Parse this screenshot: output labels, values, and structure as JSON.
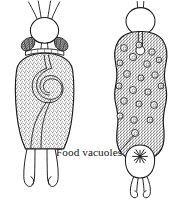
{
  "figure": {
    "kind": "scientific-line-illustration",
    "background_color": "#ffffff",
    "ink_color": "#1a1a1a",
    "stipple_color": "#8a8a8a",
    "width": 179,
    "height": 209
  },
  "annotations": {
    "food_vacuoles_label": "Food vacuoles"
  },
  "specimens": [
    {
      "id": "left-specimen",
      "name": "left-specimen-with-coiled-gut",
      "position": "left",
      "parts": [
        "apical-setae",
        "head-capsule",
        "paired-mandible-clusters",
        "stippled-trunk",
        "coiled-gut-loop",
        "forked-toes"
      ],
      "setae_count": 4,
      "mandible_cluster_count": 2,
      "toe_count": 2
    },
    {
      "id": "right-specimen",
      "name": "right-specimen-with-food-vacuoles",
      "position": "right",
      "parts": [
        "apical-setae",
        "head-capsule",
        "stippled-trunk",
        "food-vacuoles",
        "egg-sac-with-star",
        "forked-toes"
      ],
      "setae_count": 2,
      "vacuole_count": 21,
      "toe_count": 2
    }
  ],
  "vacuoles": [
    {
      "cx": 124,
      "cy": 48,
      "r": 3.4
    },
    {
      "cx": 139,
      "cy": 45,
      "r": 3.0
    },
    {
      "cx": 152,
      "cy": 52,
      "r": 3.2
    },
    {
      "cx": 133,
      "cy": 57,
      "r": 3.6
    },
    {
      "cx": 120,
      "cy": 63,
      "r": 3.0
    },
    {
      "cx": 147,
      "cy": 64,
      "r": 3.3
    },
    {
      "cx": 159,
      "cy": 60,
      "r": 2.8
    },
    {
      "cx": 127,
      "cy": 74,
      "r": 3.4
    },
    {
      "cx": 141,
      "cy": 78,
      "r": 3.0
    },
    {
      "cx": 155,
      "cy": 75,
      "r": 3.2
    },
    {
      "cx": 119,
      "cy": 86,
      "r": 3.0
    },
    {
      "cx": 133,
      "cy": 90,
      "r": 3.5
    },
    {
      "cx": 148,
      "cy": 92,
      "r": 3.1
    },
    {
      "cx": 161,
      "cy": 86,
      "r": 2.9
    },
    {
      "cx": 124,
      "cy": 101,
      "r": 3.3
    },
    {
      "cx": 139,
      "cy": 104,
      "r": 3.0
    },
    {
      "cx": 154,
      "cy": 105,
      "r": 3.4
    },
    {
      "cx": 120,
      "cy": 116,
      "r": 3.1
    },
    {
      "cx": 134,
      "cy": 120,
      "r": 3.3
    },
    {
      "cx": 150,
      "cy": 120,
      "r": 3.0
    },
    {
      "cx": 135,
      "cy": 133,
      "r": 3.5
    }
  ],
  "leader_line": {
    "from_x": 120,
    "from_y": 151,
    "to_x": 134,
    "to_y": 135
  },
  "label_position": {
    "x": 56,
    "y": 156
  }
}
